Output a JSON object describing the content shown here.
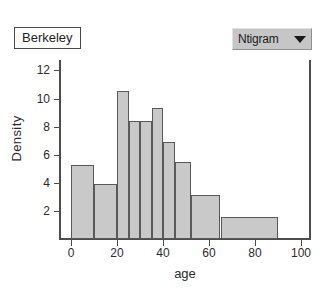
{
  "window": {
    "title": "Berkeley"
  },
  "dataset_label": {
    "text": "Berkeley"
  },
  "chart_type_dropdown": {
    "value": "Ntigram",
    "caret_icon": "chevron-down-icon"
  },
  "colors": {
    "bar_fill": "#c9c9c9",
    "bar_stroke": "#595959",
    "axis": "#4d4d4d",
    "dropdown_background": "#c6c6c6",
    "text": "#2b2b2b",
    "plot_background": "#ffffff"
  },
  "chart_data": {
    "type": "bar",
    "title": "",
    "subtitle": "",
    "xlabel": "age",
    "ylabel": "Density",
    "xlim": [
      0,
      105
    ],
    "ylim": [
      0,
      13
    ],
    "grid": false,
    "legend": "none",
    "x_ticks": [
      0,
      20,
      40,
      60,
      80,
      100
    ],
    "x_tick_labels": [
      "0",
      "20",
      "40",
      "60",
      "80",
      "100"
    ],
    "y_ticks": [
      2,
      4,
      6,
      8,
      10,
      12
    ],
    "y_tick_labels": [
      "2",
      "4",
      "6",
      "8",
      "10",
      "12"
    ],
    "bin_edges": [
      0,
      10,
      20,
      25,
      30,
      35,
      40,
      45,
      52,
      65,
      90
    ],
    "categories": [
      "0-10",
      "10-20",
      "20-25",
      "25-30",
      "30-35",
      "35-40",
      "40-45",
      "45-52",
      "52-65",
      "65-90"
    ],
    "values": [
      5.3,
      3.9,
      10.5,
      8.4,
      8.4,
      9.3,
      6.9,
      5.5,
      3.1,
      1.6
    ],
    "bars": [
      {
        "x0": 0,
        "x1": 10,
        "value": 5.3
      },
      {
        "x0": 10,
        "x1": 20,
        "value": 3.9
      },
      {
        "x0": 20,
        "x1": 25,
        "value": 10.5
      },
      {
        "x0": 25,
        "x1": 30,
        "value": 8.4
      },
      {
        "x0": 30,
        "x1": 35,
        "value": 8.4
      },
      {
        "x0": 35,
        "x1": 40,
        "value": 9.3
      },
      {
        "x0": 40,
        "x1": 45,
        "value": 6.9
      },
      {
        "x0": 45,
        "x1": 52,
        "value": 5.5
      },
      {
        "x0": 52,
        "x1": 65,
        "value": 3.1
      },
      {
        "x0": 65,
        "x1": 90,
        "value": 1.6
      }
    ]
  }
}
